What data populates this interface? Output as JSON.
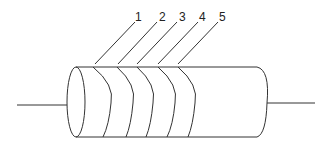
{
  "diagram": {
    "type": "resistor-color-bands",
    "labels": [
      {
        "text": "1",
        "x": 138,
        "y": 21,
        "tip_x": 135,
        "tip_y": 22,
        "base_x": 95,
        "base_y": 64
      },
      {
        "text": "2",
        "x": 162,
        "y": 21,
        "tip_x": 157,
        "tip_y": 22,
        "base_x": 118,
        "base_y": 64
      },
      {
        "text": "3",
        "x": 182,
        "y": 21,
        "tip_x": 177,
        "tip_y": 22,
        "base_x": 137,
        "base_y": 64
      },
      {
        "text": "4",
        "x": 202,
        "y": 21,
        "tip_x": 198,
        "tip_y": 22,
        "base_x": 158,
        "base_y": 64
      },
      {
        "text": "5",
        "x": 222,
        "y": 21,
        "tip_x": 218,
        "tip_y": 22,
        "base_x": 178,
        "base_y": 64
      }
    ],
    "colors": {
      "stroke": "#333333",
      "background": "#ffffff"
    }
  }
}
